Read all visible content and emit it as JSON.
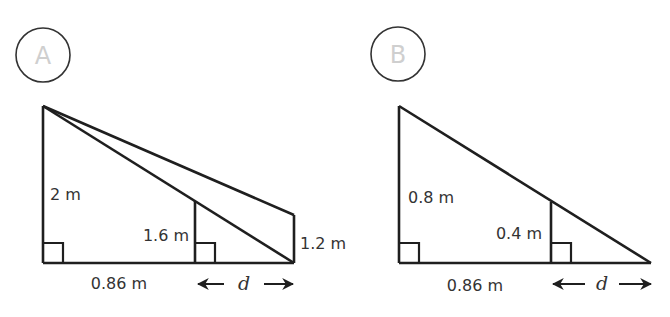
{
  "colors": {
    "stroke": "#1f1f1f",
    "label": "#333333",
    "badge_letter": "#cfcfcf"
  },
  "diagrams": [
    {
      "id": "A",
      "badge": "A",
      "labels": {
        "tall_post": "2 m",
        "middle_post": "1.6 m",
        "right_post": "1.2 m",
        "base": "0.86 m",
        "distance": "d"
      }
    },
    {
      "id": "B",
      "badge": "B",
      "labels": {
        "tall_post": "0.8 m",
        "middle_post": "0.4 m",
        "base": "0.86 m",
        "distance": "d"
      }
    }
  ]
}
